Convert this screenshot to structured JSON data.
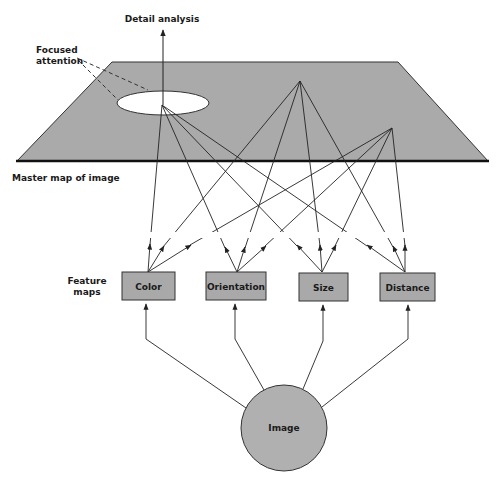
{
  "labels": {
    "detail_analysis": "Detail analysis",
    "focused_attention_line1": "Focused",
    "focused_attention_line2": "attention",
    "master_map": "Master map of image",
    "feature_maps_line1": "Feature",
    "feature_maps_line2": "maps",
    "image": "Image"
  },
  "feature_maps": [
    {
      "label": "Color"
    },
    {
      "label": "Orientation"
    },
    {
      "label": "Size"
    },
    {
      "label": "Distance"
    }
  ],
  "colors": {
    "plane_fill": "#aaaaaa",
    "box_fill": "#a9a9a9",
    "circle_fill": "#b0b0b0",
    "line": "#222222",
    "background": "#ffffff"
  }
}
